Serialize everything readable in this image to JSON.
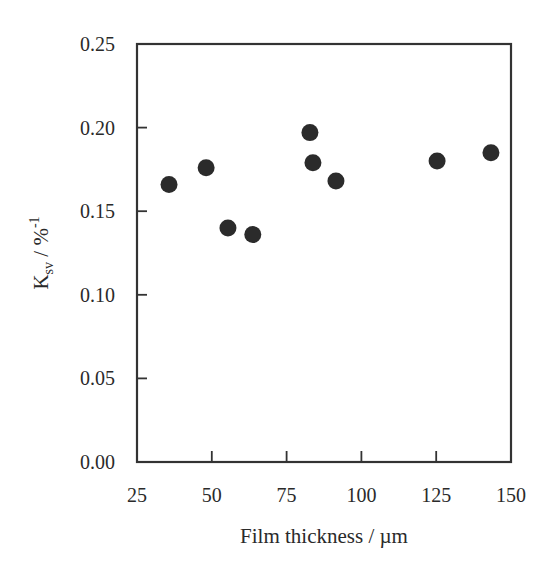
{
  "chart_data": {
    "type": "scatter",
    "title": "",
    "xlabel": "Film thickness / µm",
    "ylabel": "K_sv / %^-1",
    "ylabel_parts": {
      "main": "K",
      "sub": "sv",
      "unit": " / %",
      "sup": "-1"
    },
    "xlim": [
      25,
      150
    ],
    "ylim": [
      0.0,
      0.25
    ],
    "x_ticks": [
      25,
      50,
      75,
      100,
      125,
      150
    ],
    "x_tick_labels": [
      "25",
      "50",
      "75",
      "100",
      "125",
      "150"
    ],
    "y_ticks": [
      0.0,
      0.05,
      0.1,
      0.15,
      0.2,
      0.25
    ],
    "y_tick_labels": [
      "0.00",
      "0.05",
      "0.10",
      "0.15",
      "0.20",
      "0.25"
    ],
    "grid": false,
    "legend": null,
    "series": [
      {
        "name": "Ksv",
        "marker": "filled-circle",
        "color": "#2b2b2b",
        "x": [
          35.7,
          48.1,
          55.4,
          63.7,
          82.8,
          83.8,
          91.5,
          125.3,
          143.3
        ],
        "y": [
          0.166,
          0.176,
          0.14,
          0.136,
          0.197,
          0.179,
          0.168,
          0.18,
          0.185
        ]
      }
    ]
  }
}
